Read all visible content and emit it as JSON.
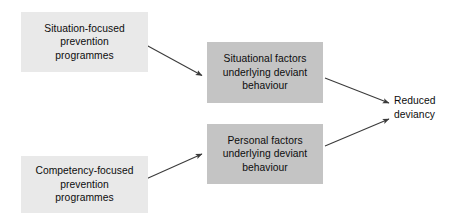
{
  "diagram": {
    "type": "flow-diagram",
    "background_color": "#ffffff",
    "text_color": "#0d0d0d",
    "node_fill_light": "#e9e9e9",
    "node_fill_mid": "#c4c4c4",
    "arrow_color": "#3a3a3a",
    "nodes": [
      {
        "id": "situation-programmes",
        "label": "Situation-focused\nprevention\nprogrammes",
        "fill": "#e9e9e9",
        "shape": "rectangle"
      },
      {
        "id": "situational-factors",
        "label": "Situational factors\nunderlying deviant\nbehaviour",
        "fill": "#c4c4c4",
        "shape": "rectangle"
      },
      {
        "id": "personal-factors",
        "label": "Personal factors\nunderlying deviant\nbehaviour",
        "fill": "#c4c4c4",
        "shape": "rectangle"
      },
      {
        "id": "competency-programmes",
        "label": "Competency-focused\nprevention\nprogrammes",
        "fill": "#e9e9e9",
        "shape": "rectangle"
      },
      {
        "id": "reduced-deviancy",
        "label": "Reduced\ndeviancy",
        "fill": "none",
        "shape": "text"
      }
    ],
    "edges": [
      {
        "id": "edge-situation-to-situational",
        "from": "situation-programmes",
        "to": "situational-factors",
        "style": "solid-arrow"
      },
      {
        "id": "edge-competency-to-personal",
        "from": "competency-programmes",
        "to": "personal-factors",
        "style": "solid-arrow"
      },
      {
        "id": "edge-situational-to-reduced",
        "from": "situational-factors",
        "to": "reduced-deviancy",
        "style": "solid-arrow"
      },
      {
        "id": "edge-personal-to-reduced",
        "from": "personal-factors",
        "to": "reduced-deviancy",
        "style": "solid-arrow"
      }
    ]
  }
}
